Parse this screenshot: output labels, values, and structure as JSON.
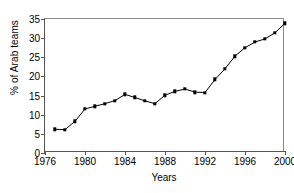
{
  "chart_data": {
    "type": "line",
    "title": "",
    "xlabel": "Years",
    "ylabel": "% of Arab teams",
    "xlim": [
      1976,
      2000
    ],
    "ylim": [
      0,
      35
    ],
    "yticks": [
      0,
      5,
      10,
      15,
      20,
      25,
      30,
      35
    ],
    "xticks": [
      1976,
      1980,
      1984,
      1988,
      1992,
      1996,
      2000
    ],
    "grid": false,
    "legend": null,
    "marker": "square",
    "line_color": "#000000",
    "marker_color": "#000000",
    "axis_color": "#555555",
    "background": "#ffffff",
    "x": [
      1977,
      1978,
      1979,
      1980,
      1981,
      1982,
      1983,
      1984,
      1985,
      1986,
      1987,
      1988,
      1989,
      1990,
      1991,
      1992,
      1993,
      1994,
      1995,
      1996,
      1997,
      1998,
      1999,
      2000
    ],
    "values": [
      6.2,
      6.1,
      8.3,
      11.5,
      12.2,
      12.9,
      13.7,
      15.3,
      14.5,
      13.6,
      12.9,
      15.1,
      16.1,
      16.7,
      15.9,
      15.8,
      19.2,
      22.0,
      25.3,
      27.5,
      29.0,
      29.8,
      31.4,
      33.9
    ]
  }
}
